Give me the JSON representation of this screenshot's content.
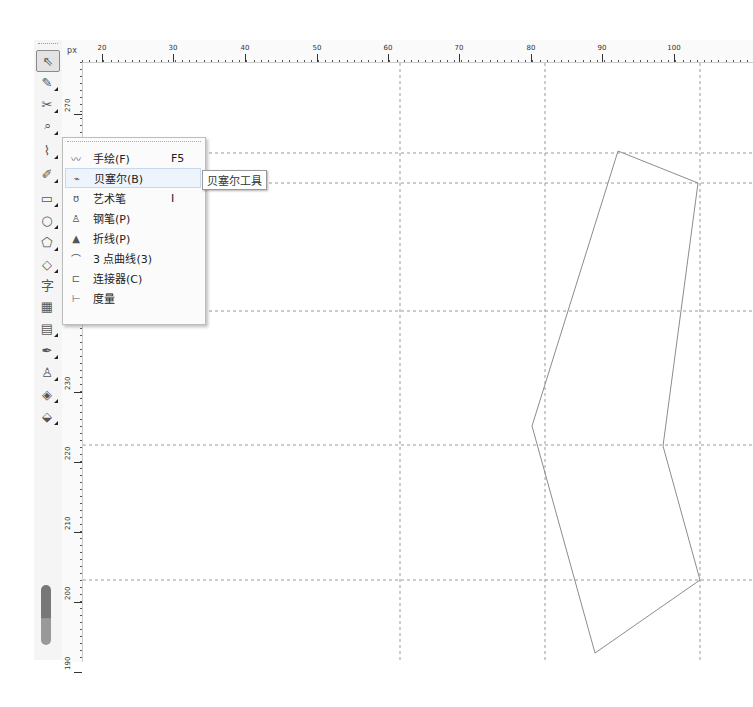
{
  "toolbox": {
    "tools": [
      {
        "name": "pick-tool",
        "glyph": "⇖",
        "top": 10,
        "active": true
      },
      {
        "name": "shape-tool",
        "glyph": "✎",
        "top": 32
      },
      {
        "name": "crop-tool",
        "glyph": "✂",
        "top": 54
      },
      {
        "name": "zoom-tool",
        "glyph": "⌕",
        "top": 76
      },
      {
        "name": "curve-tool",
        "glyph": "⌇",
        "top": 100
      },
      {
        "name": "smart-fill-tool",
        "glyph": "✐",
        "top": 124
      },
      {
        "name": "rectangle-tool",
        "glyph": "▭",
        "top": 148
      },
      {
        "name": "ellipse-tool",
        "glyph": "○",
        "top": 170
      },
      {
        "name": "polygon-tool",
        "glyph": "⬠",
        "top": 192
      },
      {
        "name": "basic-shapes-tool",
        "glyph": "◇",
        "top": 214
      },
      {
        "name": "text-tool",
        "glyph": "字",
        "top": 234
      },
      {
        "name": "table-tool",
        "glyph": "▦",
        "top": 256
      },
      {
        "name": "blend-tool",
        "glyph": "▤",
        "top": 278
      },
      {
        "name": "eyedropper-tool",
        "glyph": "✒",
        "top": 300
      },
      {
        "name": "outline-pen-tool",
        "glyph": "♙",
        "top": 322
      },
      {
        "name": "fill-tool",
        "glyph": "◈",
        "top": 344
      },
      {
        "name": "interactive-fill-tool",
        "glyph": "⬙",
        "top": 366
      }
    ]
  },
  "ruler": {
    "corner_label": "px",
    "horizontal": [
      {
        "label": "20",
        "x": 20
      },
      {
        "label": "30",
        "x": 91
      },
      {
        "label": "40",
        "x": 163
      },
      {
        "label": "50",
        "x": 235
      },
      {
        "label": "60",
        "x": 306
      },
      {
        "label": "70",
        "x": 377
      },
      {
        "label": "80",
        "x": 449
      },
      {
        "label": "90",
        "x": 520
      },
      {
        "label": "100",
        "x": 592
      }
    ],
    "vertical": [
      {
        "label": "270",
        "y": 40
      },
      {
        "label": "230",
        "y": 318
      },
      {
        "label": "220",
        "y": 388
      },
      {
        "label": "210",
        "y": 458
      },
      {
        "label": "200",
        "y": 528
      },
      {
        "label": "190",
        "y": 598
      }
    ]
  },
  "flyout_menu": {
    "items": [
      {
        "label": "手绘(F)",
        "shortcut": "F5",
        "icon": "freehand-icon",
        "glyph": "〰"
      },
      {
        "label": "贝塞尔(B)",
        "shortcut": "",
        "icon": "bezier-icon",
        "glyph": "⌁",
        "hover": true
      },
      {
        "label": "艺术笔",
        "shortcut": "I",
        "icon": "artistic-media-icon",
        "glyph": "ʊ"
      },
      {
        "label": "钢笔(P)",
        "shortcut": "",
        "icon": "pen-icon",
        "glyph": "♙"
      },
      {
        "label": "折线(P)",
        "shortcut": "",
        "icon": "polyline-icon",
        "glyph": "▲"
      },
      {
        "label": "3 点曲线(3)",
        "shortcut": "",
        "icon": "3-point-curve-icon",
        "glyph": "⌒"
      },
      {
        "label": "连接器(C)",
        "shortcut": "",
        "icon": "connector-icon",
        "glyph": "⊏"
      },
      {
        "label": "度量",
        "shortcut": "",
        "icon": "dimension-icon",
        "glyph": "⊢"
      }
    ]
  },
  "tooltip": {
    "text": "贝塞尔工具"
  },
  "canvas": {
    "guide_color": "#9a9a9a",
    "stroke_color": "#8c8c8c",
    "guides_h": [
      90,
      120,
      248,
      382,
      517
    ],
    "guides_v": [
      317,
      462,
      617
    ],
    "shape_points": "535,88 615,120 580,383 617,517 512,590 449,363"
  }
}
